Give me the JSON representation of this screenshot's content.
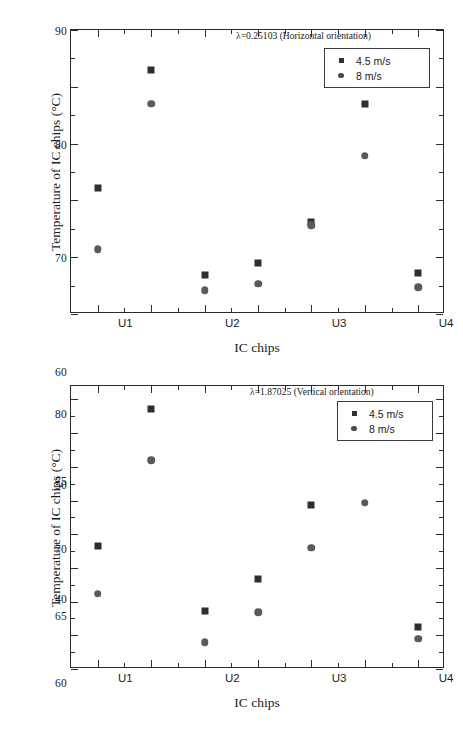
{
  "figure": {
    "panels": [
      {
        "id": "top",
        "annotation": "λ=0.25103 (Horizontal orientation)",
        "chart_data": {
          "type": "scatter",
          "title": "",
          "annotation": "λ=0.25103 (Horizontal orientation)",
          "xlabel": "IC chips",
          "ylabel": "Temperature of IC chips (°C)",
          "categories": [
            "U1",
            "U2",
            "U3",
            "U4",
            "U5",
            "U6",
            "U7"
          ],
          "ylim": [
            40,
            90
          ],
          "yticks": [
            40,
            50,
            60,
            70,
            80,
            90
          ],
          "yticks_minor": [
            45,
            55,
            65,
            75,
            85
          ],
          "grid": false,
          "legend_position": "top-right",
          "series": [
            {
              "name": "4.5 m/s",
              "marker": "square",
              "color": "#2e2e2e",
              "values": [
                62.2,
                82.9,
                46.8,
                48.9,
                56.2,
                76.9,
                47.2
              ]
            },
            {
              "name": "8 m/s",
              "marker": "circle",
              "color": "#5a5a5a",
              "values": [
                51.4,
                77.0,
                44.2,
                45.3,
                55.6,
                67.9,
                44.7
              ]
            }
          ]
        }
      },
      {
        "id": "bottom",
        "annotation": "λ=1.87025 (Vertical orientation)",
        "chart_data": {
          "type": "scatter",
          "title": "",
          "annotation": "λ=1.87025 (Vertical orientation)",
          "xlabel": "IC chips",
          "ylabel": "Temperature of IC chips (°C)",
          "categories": [
            "U1",
            "U2",
            "U3",
            "U4",
            "U5",
            "U6",
            "U7"
          ],
          "ylim": [
            40,
            82
          ],
          "yticks": [
            40,
            45,
            50,
            55,
            60,
            65,
            70,
            75,
            80
          ],
          "yticks_minor": [
            42.5,
            47.5,
            52.5,
            57.5,
            62.5,
            67.5,
            72.5,
            77.5
          ],
          "grid": false,
          "legend_position": "top-right",
          "series": [
            {
              "name": "4.5 m/s",
              "marker": "square",
              "color": "#2e2e2e",
              "values": [
                58.2,
                78.6,
                48.6,
                53.4,
                64.3,
                74.7,
                46.3
              ]
            },
            {
              "name": "8 m/s",
              "marker": "circle",
              "color": "#5a5a5a",
              "values": [
                51.2,
                71.0,
                44.0,
                48.4,
                58.0,
                64.7,
                44.5
              ]
            }
          ]
        }
      }
    ]
  }
}
